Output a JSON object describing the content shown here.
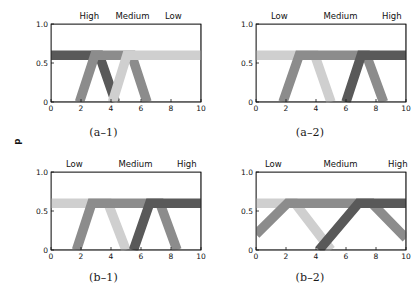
{
  "figure": {
    "background": "#ffffff",
    "panel_count": 4
  },
  "colors": {
    "high": "#595959",
    "medium": "#8c8c8c",
    "low": "#cfcfcf",
    "axis": "#111111",
    "text": "#111111"
  },
  "axes": {
    "y_label": "Degree of Membership",
    "x_ticks": [
      "0",
      "2",
      "4",
      "6",
      "8",
      "10"
    ],
    "x_tick_values": [
      0,
      2,
      4,
      6,
      8,
      10
    ],
    "y_ticks": [
      "0",
      "0.5",
      "1.0"
    ],
    "y_tick_values": [
      0,
      0.5,
      1.0
    ],
    "xlim": [
      0,
      10
    ],
    "ylim": [
      0,
      1.0
    ],
    "clip_level": 0.6
  },
  "chart_data": {
    "type": "line",
    "title": "",
    "xlabel": "",
    "ylabel": "Degree of Membership",
    "xlim": [
      0,
      10
    ],
    "ylim": [
      0,
      1.0
    ],
    "grid": false,
    "legend": "top-inside-labels",
    "panels": [
      {
        "id": "a-1",
        "caption": "(a–1)",
        "labels": [
          {
            "text": "High",
            "x": 1.9
          },
          {
            "text": "Medium",
            "x": 4.3
          },
          {
            "text": "Low",
            "x": 7.6
          }
        ],
        "series": [
          {
            "name": "High",
            "color": "#595959",
            "shape": "trapezoid",
            "points": [
              [
                0,
                1.0
              ],
              [
                2.5,
                1.0
              ],
              [
                4.3,
                0.0
              ]
            ]
          },
          {
            "name": "Medium",
            "color": "#8c8c8c",
            "shape": "trapezoid",
            "points": [
              [
                1.9,
                0.0
              ],
              [
                3.6,
                1.0
              ],
              [
                4.7,
                1.0
              ],
              [
                6.4,
                0.0
              ]
            ]
          },
          {
            "name": "Low",
            "color": "#cfcfcf",
            "shape": "trapezoid",
            "points": [
              [
                4.1,
                0.0
              ],
              [
                5.7,
                1.0
              ],
              [
                10,
                1.0
              ]
            ]
          }
        ]
      },
      {
        "id": "a-2",
        "caption": "(a–2)",
        "labels": [
          {
            "text": "Low",
            "x": 1.0
          },
          {
            "text": "Medium",
            "x": 4.5
          },
          {
            "text": "High",
            "x": 8.4
          }
        ],
        "series": [
          {
            "name": "Low",
            "color": "#cfcfcf",
            "shape": "trapezoid",
            "points": [
              [
                0,
                1.0
              ],
              [
                3.2,
                1.0
              ],
              [
                5.0,
                0.0
              ]
            ]
          },
          {
            "name": "Medium",
            "color": "#8c8c8c",
            "shape": "trapezoid",
            "points": [
              [
                1.8,
                0.0
              ],
              [
                3.6,
                1.0
              ],
              [
                6.6,
                1.0
              ],
              [
                8.5,
                0.0
              ]
            ]
          },
          {
            "name": "High",
            "color": "#595959",
            "shape": "trapezoid",
            "points": [
              [
                6.0,
                0.0
              ],
              [
                7.7,
                1.0
              ],
              [
                10,
                1.0
              ]
            ]
          }
        ]
      },
      {
        "id": "b-1",
        "caption": "(b–1)",
        "labels": [
          {
            "text": "Low",
            "x": 1.0
          },
          {
            "text": "Medium",
            "x": 4.5
          },
          {
            "text": "High",
            "x": 8.4
          }
        ],
        "series": [
          {
            "name": "Low",
            "color": "#cfcfcf",
            "shape": "trapezoid",
            "points": [
              [
                0,
                1.0
              ],
              [
                3.0,
                1.0
              ],
              [
                5.0,
                0.0
              ]
            ]
          },
          {
            "name": "Medium",
            "color": "#8c8c8c",
            "shape": "trapezoid",
            "points": [
              [
                1.7,
                0.0
              ],
              [
                3.4,
                1.0
              ],
              [
                6.5,
                1.0
              ],
              [
                8.4,
                0.0
              ]
            ]
          },
          {
            "name": "High",
            "color": "#595959",
            "shape": "trapezoid",
            "points": [
              [
                5.5,
                0.0
              ],
              [
                7.3,
                1.0
              ],
              [
                10,
                1.0
              ]
            ]
          }
        ]
      },
      {
        "id": "b-2",
        "caption": "(b–2)",
        "labels": [
          {
            "text": "Low",
            "x": 0.6
          },
          {
            "text": "Medium",
            "x": 4.5
          },
          {
            "text": "High",
            "x": 8.8
          }
        ],
        "series": [
          {
            "name": "Low",
            "color": "#cfcfcf",
            "shape": "trapezoid",
            "points": [
              [
                0,
                1.0
              ],
              [
                1.0,
                1.0
              ],
              [
                5.0,
                0.0
              ]
            ]
          },
          {
            "name": "Medium",
            "color": "#8c8c8c",
            "shape": "trapezoid",
            "points": [
              [
                0,
                0.2
              ],
              [
                4.2,
                1.0
              ],
              [
                5.7,
                1.0
              ],
              [
                10,
                0.15
              ]
            ]
          },
          {
            "name": "High",
            "color": "#595959",
            "shape": "trapezoid",
            "points": [
              [
                4.2,
                0.0
              ],
              [
                8.6,
                1.0
              ],
              [
                10,
                1.0
              ]
            ]
          }
        ]
      }
    ]
  }
}
